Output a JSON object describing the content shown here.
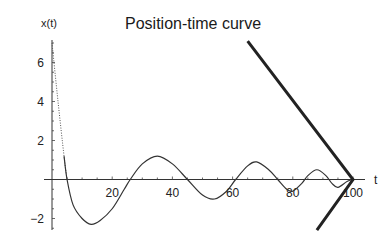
{
  "chart_data": {
    "type": "line",
    "title": "Position-time curve",
    "xlabel": "t",
    "ylabel": "x(t)",
    "xlim": [
      0,
      102
    ],
    "ylim": [
      -2.5,
      7.5
    ],
    "x_ticks": [
      20,
      40,
      60,
      80,
      100
    ],
    "y_ticks": [
      -2,
      2,
      4,
      6
    ],
    "grid": false,
    "legend": null,
    "series": [
      {
        "name": "x(t)",
        "style": "thin solid (dotted near t=0)",
        "points": [
          [
            0,
            7.0
          ],
          [
            2,
            4.0
          ],
          [
            4,
            1.2
          ],
          [
            5,
            0.0
          ],
          [
            7,
            -1.3
          ],
          [
            10,
            -2.0
          ],
          [
            13,
            -2.3
          ],
          [
            16,
            -2.1
          ],
          [
            20,
            -1.5
          ],
          [
            24,
            -0.5
          ],
          [
            26,
            0.0
          ],
          [
            30,
            0.8
          ],
          [
            35,
            1.2
          ],
          [
            40,
            0.8
          ],
          [
            45,
            0.0
          ],
          [
            50,
            -0.8
          ],
          [
            54,
            -1.0
          ],
          [
            58,
            -0.6
          ],
          [
            61,
            0.0
          ],
          [
            65,
            0.7
          ],
          [
            68,
            0.9
          ],
          [
            72,
            0.5
          ],
          [
            75,
            0.0
          ],
          [
            78,
            -0.5
          ],
          [
            80,
            -0.6
          ],
          [
            83,
            -0.2
          ],
          [
            85,
            0.2
          ],
          [
            88,
            0.5
          ],
          [
            91,
            0.2
          ],
          [
            93,
            -0.2
          ],
          [
            95,
            -0.4
          ],
          [
            98,
            -0.1
          ],
          [
            100,
            0.0
          ]
        ]
      },
      {
        "name": "envelope",
        "style": "thick solid V",
        "points": [
          [
            65,
            7.1
          ],
          [
            100,
            0.0
          ],
          [
            88,
            -2.6
          ]
        ]
      }
    ]
  }
}
